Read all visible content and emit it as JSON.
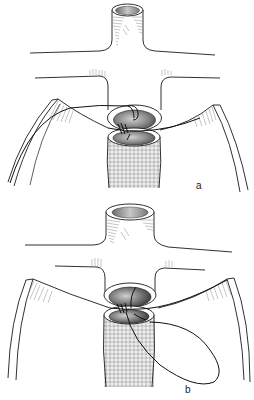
{
  "figure": {
    "panels": [
      {
        "id": "a",
        "label": "a",
        "caption_note": "Posterior wall suturing, suture passed through vessel and graft"
      },
      {
        "id": "b",
        "label": "b",
        "caption_note": "Continuation of running suture with looped thread"
      }
    ]
  },
  "colors": {
    "line": "#1a1a1a",
    "hatch": "#8a8a8a",
    "lumen_dark": "#5a5a5a",
    "lumen_mid": "#9a9a9a",
    "lumen_light": "#d8d8d8",
    "graft_fill": "#e6e6e6",
    "graft_mesh": "#8c8c8c",
    "background": "#ffffff"
  }
}
